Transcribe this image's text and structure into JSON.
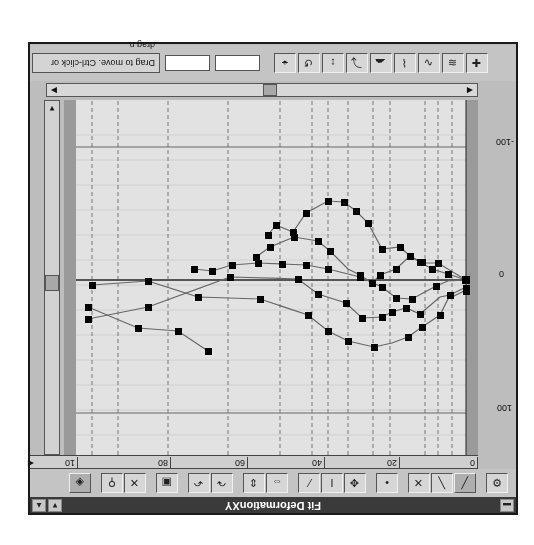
{
  "window": {
    "title": "Fit DeformationXY",
    "close_label": "▬",
    "up_label": "▲",
    "down_label": "▼"
  },
  "toolbar_top": {
    "buttons": [
      {
        "name": "options-button",
        "glyph": "⚙"
      },
      {
        "name": "curve-a-button",
        "glyph": "╱"
      },
      {
        "name": "curve-b-button",
        "glyph": "╲"
      },
      {
        "name": "curve-c-button",
        "glyph": "✕"
      },
      {
        "name": "select-point-button",
        "glyph": "•"
      },
      {
        "name": "move-button",
        "glyph": "✥"
      },
      {
        "name": "vertical-bar-button",
        "glyph": "I"
      },
      {
        "name": "curve-fit-button",
        "glyph": "⁄"
      },
      {
        "name": "expand-h-button",
        "glyph": "⇔"
      },
      {
        "name": "expand-v-button",
        "glyph": "⇕"
      },
      {
        "name": "redo-button",
        "glyph": "↷"
      },
      {
        "name": "undo-button",
        "glyph": "↶"
      },
      {
        "name": "lock-button",
        "glyph": "▣"
      },
      {
        "name": "delete-button",
        "glyph": "✕"
      },
      {
        "name": "pin-button",
        "glyph": "⚲"
      },
      {
        "name": "snapshot-button",
        "glyph": "◈"
      }
    ]
  },
  "x_axis": {
    "ticks": [
      "0",
      "20",
      "40",
      "60",
      "80",
      "10"
    ]
  },
  "y_axis": {
    "ticks": [
      "100",
      "0",
      "-100"
    ]
  },
  "toolbar_bottom": {
    "status_text": "Drag to move. Ctrl-click or drag n",
    "field_1": "",
    "field_2": "",
    "buttons": [
      {
        "name": "add-point-button",
        "glyph": "✚"
      },
      {
        "name": "tool-1-button",
        "glyph": "≋"
      },
      {
        "name": "tool-2-button",
        "glyph": "∿"
      },
      {
        "name": "tool-3-button",
        "glyph": "⌇"
      },
      {
        "name": "tool-4-button",
        "glyph": "☁"
      },
      {
        "name": "tool-5-button",
        "glyph": "⤵"
      },
      {
        "name": "tool-6-button",
        "glyph": "↕"
      },
      {
        "name": "tool-7-button",
        "glyph": "↺"
      },
      {
        "name": "tool-8-button",
        "glyph": "⌖"
      }
    ]
  },
  "curves": [
    {
      "name": "curve-1",
      "points": [
        [
          0,
          0
        ],
        [
          8,
          -8
        ],
        [
          16,
          -6
        ],
        [
          22,
          -15
        ],
        [
          26,
          -20
        ],
        [
          33,
          -22
        ],
        [
          40,
          -40
        ],
        [
          48,
          -68
        ],
        [
          58,
          -78
        ],
        [
          70,
          -85
        ],
        [
          82,
          -85
        ],
        [
          94,
          -80
        ],
        [
          104,
          -64
        ],
        [
          108,
          -35
        ]
      ]
    },
    {
      "name": "curve-2",
      "points": [
        [
          0,
          0
        ],
        [
          8,
          -8
        ],
        [
          14,
          -12
        ],
        [
          24,
          -20
        ],
        [
          28,
          -23
        ],
        [
          34,
          -18
        ],
        [
          42,
          -12
        ],
        [
          45,
          -10
        ],
        [
          52,
          -15
        ],
        [
          58,
          -18
        ],
        [
          66,
          -34
        ],
        [
          72,
          -40
        ],
        [
          82,
          -44
        ],
        [
          94,
          -37
        ],
        [
          104,
          -22
        ]
      ]
    },
    {
      "name": "curve-3",
      "points": [
        [
          0,
          0
        ],
        [
          8,
          2
        ],
        [
          14,
          5
        ],
        [
          22,
          18
        ],
        [
          28,
          20
        ],
        [
          32,
          16
        ],
        [
          42,
          9
        ],
        [
          56,
          5
        ],
        [
          66,
          3
        ],
        [
          76,
          2
        ],
        [
          84,
          1
        ],
        [
          94,
          -5
        ],
        [
          102,
          -5
        ],
        [
          106,
          -8
        ]
      ]
    },
    {
      "name": "curve-4",
      "points": [
        [
          0,
          -8
        ],
        [
          8,
          -15
        ],
        [
          14,
          -18
        ],
        [
          22,
          -25
        ],
        [
          30,
          -24
        ],
        [
          38,
          -28
        ],
        [
          42,
          -28
        ],
        [
          50,
          -25
        ],
        [
          56,
          -18
        ],
        [
          66,
          -8
        ],
        [
          82,
          -4
        ],
        [
          98,
          -18
        ],
        [
          104,
          -25
        ],
        [
          108,
          -30
        ]
      ]
    },
    {
      "name": "curve-5",
      "points": [
        [
          0,
          -10
        ],
        [
          8,
          -20
        ],
        [
          12,
          -30
        ],
        [
          18,
          -40
        ],
        [
          22,
          -50
        ],
        [
          26,
          -58
        ],
        [
          32,
          -62
        ],
        [
          40,
          -55
        ],
        [
          46,
          -48
        ],
        [
          52,
          -40
        ]
      ]
    }
  ]
}
